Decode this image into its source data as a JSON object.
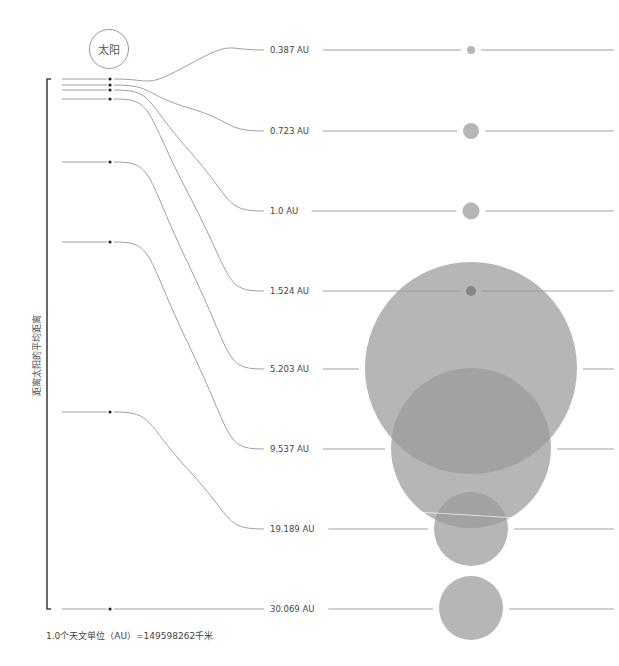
{
  "sun": {
    "label": "太阳"
  },
  "axis_label": "距离太阳的平均距离",
  "footnote": "1.0个天文单位（AU）=149598262千米",
  "colors": {
    "line": "#a0a0a0",
    "planet": "#b4b4b4",
    "planet_dark": "#7f7f7f",
    "bracket": "#444444",
    "dot": "#222222"
  },
  "chart_data": {
    "type": "diagram",
    "title": "距离太阳的平均距离",
    "unit": "AU",
    "unit_definition": "1.0 AU = 149598262 km",
    "distances_au": [
      0.387,
      0.723,
      1.0,
      1.524,
      5.203,
      9.537,
      19.189,
      30.069
    ],
    "labels": [
      "0.387 AU",
      "0.723 AU",
      "1.0 AU",
      "1.524 AU",
      "5.203 AU",
      "9.537 AU",
      "19.189 AU",
      "30.069 AU"
    ],
    "relative_circle_radius_px": [
      4,
      8,
      8.5,
      5,
      106,
      80,
      37,
      32
    ]
  },
  "rows": [
    {
      "label": "0.387 AU",
      "left_y": 79,
      "right_y": 50,
      "r": 4,
      "cy": 50,
      "dark": false
    },
    {
      "label": "0.723 AU",
      "left_y": 85,
      "right_y": 131,
      "r": 8,
      "cy": 131,
      "dark": false
    },
    {
      "label": "1.0 AU",
      "left_y": 90,
      "right_y": 211,
      "r": 8.5,
      "cy": 211,
      "dark": false
    },
    {
      "label": "1.524 AU",
      "left_y": 99,
      "right_y": 291,
      "r": 5,
      "cy": 291,
      "dark": true
    },
    {
      "label": "5.203 AU",
      "left_y": 162,
      "right_y": 369,
      "r": 106,
      "cy": 368,
      "dark": false
    },
    {
      "label": "9.537 AU",
      "left_y": 242,
      "right_y": 449,
      "r": 80,
      "cy": 448,
      "dark": false
    },
    {
      "label": "19.189 AU",
      "left_y": 412,
      "right_y": 529,
      "r": 37,
      "cy": 529,
      "dark": false
    },
    {
      "label": "30.069 AU",
      "left_y": 609,
      "right_y": 609,
      "r": 32,
      "cy": 608,
      "dark": false
    }
  ]
}
